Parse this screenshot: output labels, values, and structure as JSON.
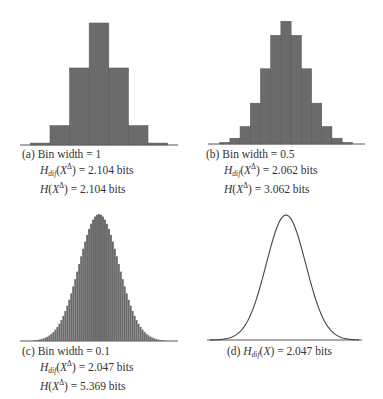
{
  "colors": {
    "bar": "#6b6b6b",
    "bar_edge": "#5a5a5a",
    "axis": "#555555",
    "curve": "#444444",
    "text": "#333333"
  },
  "panels": [
    {
      "id": "a",
      "label": "(a)",
      "line1": "Bin width = 1",
      "hdif_value": "= 2.104 bits",
      "h_value": "= 2.104 bits"
    },
    {
      "id": "b",
      "label": "(b)",
      "line1": "Bin width = 0.5",
      "hdif_value": "= 2.062 bits",
      "h_value": "= 3.062 bits"
    },
    {
      "id": "c",
      "label": "(c)",
      "line1": "Bin width = 0.1",
      "hdif_value": "= 2.047 bits",
      "h_value": "= 5.369 bits"
    },
    {
      "id": "d",
      "label": "(d)",
      "hdif_value": "= 2.047 bits"
    }
  ],
  "chart_data": [
    {
      "type": "bar",
      "title": "(a) Bin width = 1",
      "distribution": "Gaussian, sigma = 1, mean = 0",
      "bin_width": 1,
      "categories": [
        -3,
        -2,
        -1,
        0,
        1,
        2,
        3
      ],
      "values": [
        0.006,
        0.061,
        0.242,
        0.383,
        0.242,
        0.061,
        0.006
      ],
      "annotations": [
        "H_dif(X^Δ) = 2.104 bits",
        "H(X^Δ) = 2.104 bits"
      ],
      "grid": false
    },
    {
      "type": "bar",
      "title": "(b) Bin width = 0.5",
      "distribution": "Gaussian, sigma = 1, mean = 0",
      "bin_width": 0.5,
      "categories": [
        -3,
        -2.5,
        -2,
        -1.5,
        -1,
        -0.5,
        0,
        0.5,
        1,
        1.5,
        2,
        2.5,
        3
      ],
      "values": [
        0.002,
        0.009,
        0.029,
        0.067,
        0.12,
        0.175,
        0.197,
        0.175,
        0.12,
        0.067,
        0.029,
        0.009,
        0.002
      ],
      "annotations": [
        "H_dif(X^Δ) = 2.062 bits",
        "H(X^Δ) = 3.062 bits"
      ],
      "grid": false
    },
    {
      "type": "bar",
      "title": "(c) Bin width = 0.1",
      "distribution": "Gaussian, sigma = 1, mean = 0",
      "bin_width": 0.1,
      "x_range": [
        -4,
        4
      ],
      "annotations": [
        "H_dif(X^Δ) = 2.047 bits",
        "H(X^Δ) = 5.369 bits"
      ],
      "grid": false
    },
    {
      "type": "line",
      "title": "(d) H_dif(X) = 2.047 bits",
      "distribution": "Gaussian pdf, sigma = 1, mean = 0",
      "x_range": [
        -4,
        4
      ],
      "annotations": [
        "H_dif(X) = 2.047 bits"
      ],
      "grid": false
    }
  ]
}
